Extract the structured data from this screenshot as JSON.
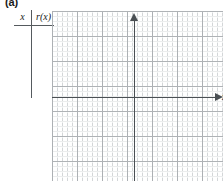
{
  "figure": {
    "panel_label": "(a)",
    "function_name": "r(x)"
  },
  "value_table": {
    "columns": [
      "x",
      "r(x)"
    ],
    "rows": []
  },
  "chart_data": {
    "type": "line",
    "title": "",
    "subtitle": "",
    "series": [],
    "x": [],
    "values": [],
    "xlabel": "x",
    "ylabel": "r(x)",
    "axis_label_y": "r(x)",
    "axis_label_x": "x",
    "xlim": [
      -16,
      17
    ],
    "ylim": [
      -17,
      17
    ],
    "grid": true,
    "grid_minor_step": 1,
    "grid_major_step": 5,
    "legend": "none",
    "annotations": [],
    "note": "Empty coordinate grid with labeled axes; no data plotted."
  },
  "colors": {
    "grid_minor": "#b9bdc1",
    "grid_major": "#a5a9ad",
    "axis": "#4a4f53",
    "text": "#1a1a1a",
    "rule": "#555a5e",
    "background": "#ffffff"
  }
}
